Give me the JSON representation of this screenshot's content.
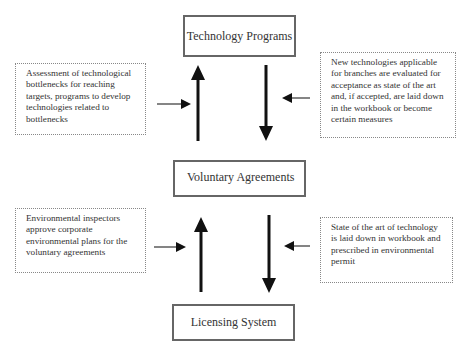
{
  "diagram": {
    "nodes": {
      "technology_programs": "Technology Programs",
      "voluntary_agreements": "Voluntary Agreements",
      "licensing_system": "Licensing System"
    },
    "annotations": {
      "top_left": "Assessment of technological bottlenecks for reaching targets, programs to develop technologies related to bottlenecks",
      "top_right": "New technologies applicable for branches are evaluated for acceptance as state of the art and, if accepted, are laid down in the workbook or become certain  measures",
      "bottom_left": "Environmental inspectors approve corporate environmental plans for the voluntary agreements",
      "bottom_right": "State of the art of technology is laid down in workbook and prescribed in environmental permit"
    },
    "edges": [
      {
        "from": "voluntary_agreements",
        "to": "technology_programs",
        "label_ref": "top_left"
      },
      {
        "from": "technology_programs",
        "to": "voluntary_agreements",
        "label_ref": "top_right"
      },
      {
        "from": "licensing_system",
        "to": "voluntary_agreements",
        "label_ref": "bottom_left"
      },
      {
        "from": "voluntary_agreements",
        "to": "licensing_system",
        "label_ref": "bottom_right"
      }
    ],
    "colors": {
      "box_border": "#666666",
      "arrow": "#111111",
      "text": "#333333"
    }
  }
}
